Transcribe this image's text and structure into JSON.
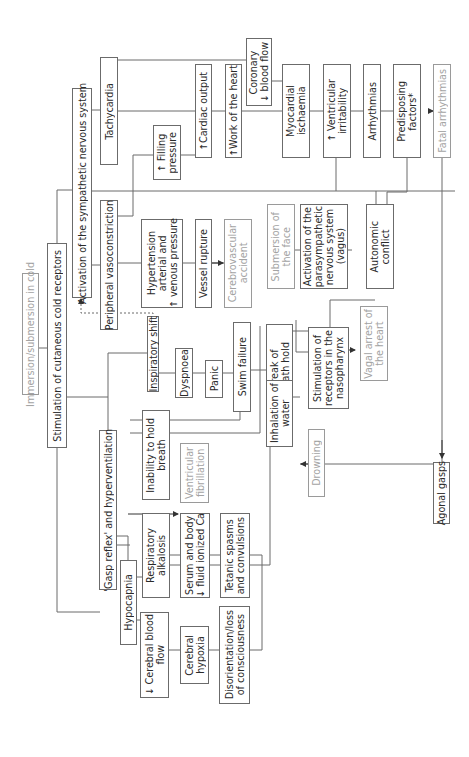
{
  "diagram": {
    "orientation": "rotated 90° counter-clockwise",
    "nodes": {
      "immersion": "Immersion/submersion in cold",
      "stimulation": "Stimulation of cutaneous cold receptors",
      "sympathetic": "Activation of the sympathetic nervous system",
      "gasp": "'Gasp reflex' and hyperventilation",
      "tachycardia": "Tachycardia",
      "vasoconstriction": "Peripheral vasoconstriction",
      "filling": "↑ Filling\npressure",
      "cardiac_output": "↑Cardiac output",
      "work_heart": "↑Work of the heart",
      "coronary": "Coronary\n↓ blood flow",
      "myocardial": "Myocardial\nischaemia",
      "ventricular_irritability": "↑ Ventricular\nirritability",
      "arrhythmias": "Arrhythmias",
      "predisposing": "Predisposing\nfactors*",
      "fatal": "Fatal arrhythmias",
      "hypertension": "Hypertension\narterial and\n↑ venous pressure",
      "vessel_rupture": "Vessel rupture",
      "cerebrovascular": "Cerebrovascular\naccident",
      "submersion_face": "Submersion of\nthe face",
      "parasympathetic": "Activation of the\nparasympathetic\nnervous system\n(vagus)",
      "autonomic": "Autonomic\nconflict",
      "inspiratory": "Inspiratory shift",
      "dyspnoea": "Dyspnoea",
      "panic": "Panic",
      "swim_failure": "Swim failure",
      "break_breath": "Break of\nbreath hold",
      "nasopharynx": "Stimulation of\nreceptors in the\nnasopharynx",
      "vagal_arrest": "Vagal arrest of\nthe heart",
      "inhalation": "Inhalation of\nwater",
      "drowning": "Drowning",
      "agonal": "Agonal gasps",
      "inability": "Inability to hold\nbreath",
      "ventricular_fibrillation": "Ventricular\nfibrillation",
      "hypocapnia": "Hypocapnia",
      "resp_alkalosis": "Respiratory\nalkalosis",
      "serum_ca": "Serum and body\n↓ fluid ionized Ca",
      "tetanic": "Tetanic spasms\nand convulsions",
      "cerebral_flow": "↓ Cerebral blood\nflow",
      "cerebral_hypoxia": "Cerebral\nhypoxia",
      "disorientation": "Disorientation/loss\nof consciousness"
    },
    "colors": {
      "line": "#6b6b6b",
      "text": "#2a2a2a",
      "outcome_text": "#a3a3a3"
    }
  }
}
